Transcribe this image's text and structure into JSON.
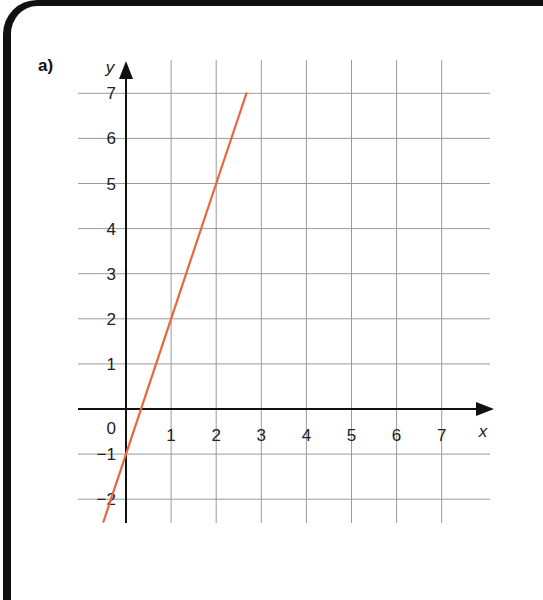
{
  "question": {
    "part_label": "a)"
  },
  "chart_data": {
    "type": "line",
    "title": "",
    "xlabel": "x",
    "ylabel": "y",
    "xlim": [
      -1,
      8
    ],
    "ylim": [
      -2.5,
      7.6
    ],
    "grid": true,
    "x_ticks": [
      "1",
      "2",
      "3",
      "4",
      "5",
      "6",
      "7"
    ],
    "y_ticks": [
      "7",
      "6",
      "5",
      "4",
      "3",
      "2",
      "1",
      "0",
      "-1",
      "-2"
    ],
    "origin_label": "0",
    "series": [
      {
        "name": "y = 3x - 1",
        "color": "#e8663d",
        "x": [
          -0.5,
          0,
          1,
          2,
          2.67
        ],
        "y": [
          -2.5,
          -1,
          2,
          5,
          7
        ]
      }
    ]
  },
  "colors": {
    "line": "#e8663d",
    "grid": "#9a9a9a",
    "axis": "#111111",
    "border": "#111111"
  }
}
